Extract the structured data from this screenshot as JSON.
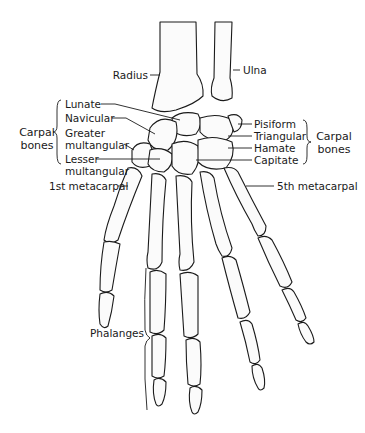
{
  "diagram": {
    "labels": {
      "radius": "Radius",
      "ulna": "Ulna",
      "lunate": "Lunate",
      "navicular": "Navicular",
      "greater_multangular_1": "Greater",
      "greater_multangular_2": "multangular",
      "lesser_multangular_1": "Lesser",
      "lesser_multangular_2": "multangular",
      "first_metacarpal": "1st metacarpal",
      "pisiform": "Pisiform",
      "triangular": "Triangular",
      "hamate": "Hamate",
      "capitate": "Capitate",
      "fifth_metacarpal": "5th metacarpal",
      "phalanges": "Phalanges"
    },
    "groups": {
      "carpal_left_1": "Carpal",
      "carpal_left_2": "bones",
      "carpal_right_1": "Carpal",
      "carpal_right_2": "bones"
    },
    "colors": {
      "ink": "#1b1b1b",
      "bone_fill": "#fbfbfb",
      "background": "#ffffff"
    }
  }
}
